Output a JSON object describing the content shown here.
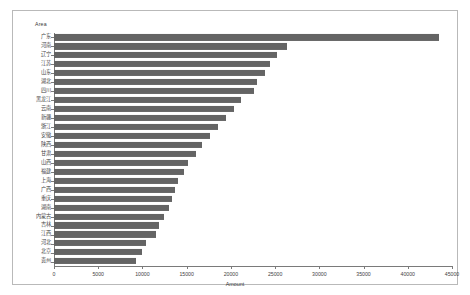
{
  "chart_data": {
    "type": "bar",
    "orientation": "horizontal",
    "title": "",
    "xlabel": "Amount",
    "ylabel": "Area",
    "xlim": [
      0,
      45000
    ],
    "xticks": [
      0,
      5000,
      10000,
      15000,
      20000,
      25000,
      30000,
      35000,
      40000,
      45000
    ],
    "xtick_labels": [
      "0",
      "5000",
      "10000",
      "15000",
      "20000",
      "25000",
      "30000",
      "35000",
      "40000",
      "45000"
    ],
    "grid": false,
    "legend": false,
    "bar_color": "#646464",
    "categories": [
      "广东",
      "河南",
      "辽宁",
      "江苏",
      "山东",
      "湖北",
      "四川",
      "黑龙江",
      "云南",
      "新疆",
      "浙江",
      "安徽",
      "陕西",
      "甘肃",
      "山西",
      "福建",
      "上海",
      "广西",
      "重庆",
      "湖南",
      "内蒙古",
      "吉林",
      "江西",
      "河北",
      "北京",
      "贵州"
    ],
    "values": [
      43500,
      26400,
      25200,
      24400,
      23900,
      23000,
      22600,
      21100,
      20400,
      19500,
      18500,
      17600,
      16700,
      16000,
      15200,
      14700,
      14000,
      13700,
      13300,
      13000,
      12400,
      11900,
      11500,
      10400,
      9900,
      9300
    ],
    "series": [
      {
        "name": "Amount",
        "values": [
          43500,
          26400,
          25200,
          24400,
          23900,
          23000,
          22600,
          21100,
          20400,
          19500,
          18500,
          17600,
          16700,
          16000,
          15200,
          14700,
          14000,
          13700,
          13300,
          13000,
          12400,
          11900,
          11500,
          10400,
          9900,
          9300
        ]
      }
    ]
  }
}
